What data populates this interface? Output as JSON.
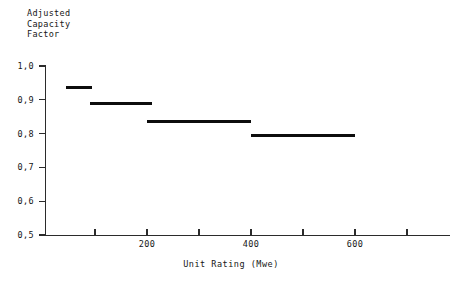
{
  "chart_data": {
    "type": "bar",
    "title": "",
    "ylabel": "Adjusted Capacity Factor",
    "ylabel_lines": [
      "Adjusted",
      "Capacity",
      "Factor"
    ],
    "xlabel": "Unit Rating (Mwe)",
    "ylim": [
      0.5,
      1.0
    ],
    "xlim": [
      0,
      780
    ],
    "grid": false,
    "legend": null,
    "y_ticks": [
      {
        "value": 1.0,
        "label": "1,0"
      },
      {
        "value": 0.9,
        "label": "0,9"
      },
      {
        "value": 0.8,
        "label": "0,8"
      },
      {
        "value": 0.7,
        "label": "0,7"
      },
      {
        "value": 0.6,
        "label": "0,6"
      },
      {
        "value": 0.5,
        "label": "0,5"
      }
    ],
    "x_ticks": [
      {
        "value": 100,
        "label": ""
      },
      {
        "value": 200,
        "label": "200"
      },
      {
        "value": 300,
        "label": ""
      },
      {
        "value": 400,
        "label": "400"
      },
      {
        "value": 500,
        "label": ""
      },
      {
        "value": 600,
        "label": "600"
      },
      {
        "value": 700,
        "label": ""
      }
    ],
    "categories": [
      "45-95",
      "90-210",
      "200-400",
      "400-600"
    ],
    "values": [
      0.935,
      0.89,
      0.835,
      0.795
    ],
    "steps": [
      {
        "x_start": 45,
        "x_end": 95,
        "value": 0.935
      },
      {
        "x_start": 90,
        "x_end": 210,
        "value": 0.89
      },
      {
        "x_start": 200,
        "x_end": 400,
        "value": 0.835
      },
      {
        "x_start": 400,
        "x_end": 600,
        "value": 0.795
      }
    ]
  },
  "colors": {
    "series": "#0d0d0d",
    "axis": "#2b2b2b",
    "text": "#161616",
    "background": "#ffffff"
  }
}
